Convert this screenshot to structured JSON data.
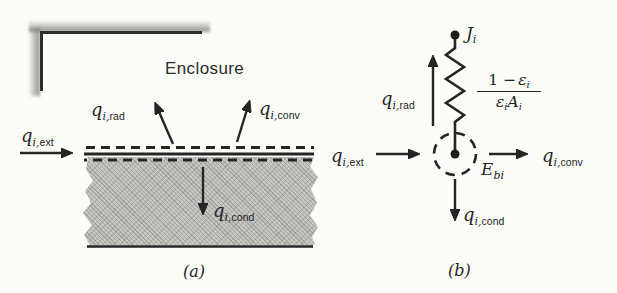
{
  "colors": {
    "paper": "#fcfcf9",
    "ink": "#252525",
    "slab_fill": "#c7c7c3",
    "wall_shadow": "#7d7d78"
  },
  "part_a": {
    "caption": "(a)",
    "enclosure_label": "Enclosure",
    "q_ext": {
      "base": "q",
      "sub_i": "i,",
      "sub": "ext"
    },
    "q_rad": {
      "base": "q",
      "sub_i": "i,",
      "sub": "rad"
    },
    "q_conv": {
      "base": "q",
      "sub_i": "i,",
      "sub": "conv"
    },
    "q_cond": {
      "base": "q",
      "sub_i": "i,",
      "sub": "cond"
    }
  },
  "part_b": {
    "caption": "(b)",
    "radiosity_node": {
      "base": "J",
      "sub": "i"
    },
    "emissive_node": {
      "base": "E",
      "sub": "bi"
    },
    "surface_resistance": {
      "num_pre": "1 −",
      "num_sym": "ε",
      "num_sub": "i",
      "den_sym1": "ε",
      "den_sub1": "i",
      "den_sym2": "A",
      "den_sub2": "i"
    },
    "q_ext": {
      "base": "q",
      "sub_i": "i,",
      "sub": "ext"
    },
    "q_rad": {
      "base": "q",
      "sub_i": "i,",
      "sub": "rad"
    },
    "q_conv": {
      "base": "q",
      "sub_i": "i,",
      "sub": "conv"
    },
    "q_cond": {
      "base": "q",
      "sub_i": "i,",
      "sub": "cond"
    }
  }
}
